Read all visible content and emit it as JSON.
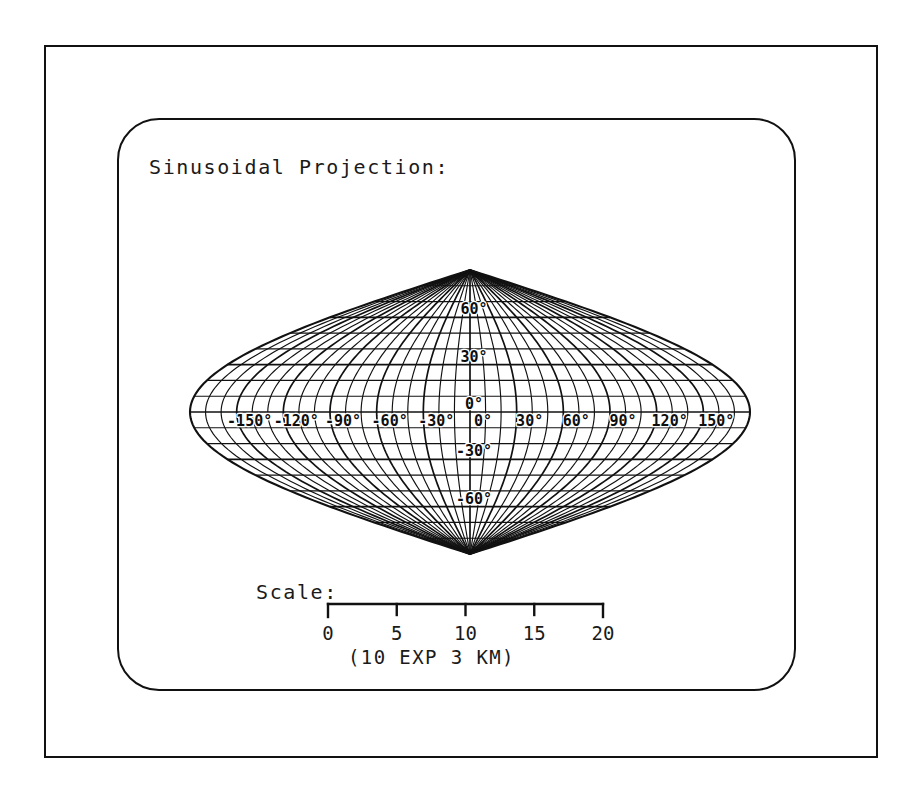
{
  "figure": {
    "title": "Sinusoidal Projection:",
    "background_color": "#ffffff",
    "ink_color": "#111111"
  },
  "chart_data": {
    "type": "map",
    "projection": "sinusoidal",
    "title": "Sinusoidal Projection:",
    "grid": true,
    "legend_position": "none",
    "xlabel": "",
    "ylabel": "",
    "xlim": [
      -180,
      180
    ],
    "ylim": [
      -90,
      90
    ],
    "graticule": {
      "meridian_step_deg": 10,
      "parallel_step_deg": 10,
      "labeled_meridian_step_deg": 30,
      "labeled_parallel_step_deg": 30,
      "central_meridian_deg": 0
    },
    "longitude_values": [
      -180,
      -170,
      -160,
      -150,
      -140,
      -130,
      -120,
      -110,
      -100,
      -90,
      -80,
      -70,
      -60,
      -50,
      -40,
      -30,
      -20,
      -10,
      0,
      10,
      20,
      30,
      40,
      50,
      60,
      70,
      80,
      90,
      100,
      110,
      120,
      130,
      140,
      150,
      160,
      170,
      180
    ],
    "latitude_values": [
      -90,
      -80,
      -70,
      -60,
      -50,
      -40,
      -30,
      -20,
      -10,
      0,
      10,
      20,
      30,
      40,
      50,
      60,
      70,
      80,
      90
    ],
    "longitude_labels": [
      {
        "value": -150,
        "text": "-150°"
      },
      {
        "value": -120,
        "text": "-120°"
      },
      {
        "value": -90,
        "text": "-90°"
      },
      {
        "value": -60,
        "text": "-60°"
      },
      {
        "value": -30,
        "text": "-30°"
      },
      {
        "value": 0,
        "text": "0°"
      },
      {
        "value": 30,
        "text": "30°"
      },
      {
        "value": 60,
        "text": "60°"
      },
      {
        "value": 90,
        "text": "90°"
      },
      {
        "value": 120,
        "text": "120°"
      },
      {
        "value": 150,
        "text": "150°"
      }
    ],
    "latitude_labels": [
      {
        "value": 60,
        "text": "60°"
      },
      {
        "value": 30,
        "text": "30°"
      },
      {
        "value": 0,
        "text": "0°"
      },
      {
        "value": -30,
        "text": "-30°"
      },
      {
        "value": -60,
        "text": "-60°"
      }
    ]
  },
  "scale": {
    "label": "Scale:",
    "ticks": [
      {
        "value": 0,
        "text": "0"
      },
      {
        "value": 5,
        "text": "5"
      },
      {
        "value": 10,
        "text": "10"
      },
      {
        "value": 15,
        "text": "15"
      },
      {
        "value": 20,
        "text": "20"
      }
    ],
    "min": 0,
    "max": 20,
    "units_caption": "(10 EXP 3 KM)"
  }
}
